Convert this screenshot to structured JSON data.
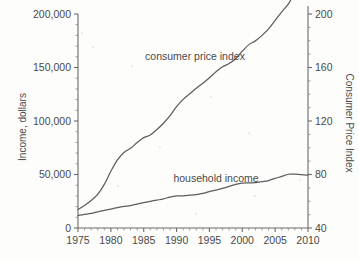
{
  "chart_data": {
    "type": "line",
    "title": "",
    "xlabel": "",
    "xlim": [
      1975,
      2010
    ],
    "x_ticks": [
      1975,
      1980,
      1985,
      1990,
      1995,
      2000,
      2005,
      2010
    ],
    "x_tick_labels": [
      "1975",
      "1980",
      "1985",
      "1990",
      "1995",
      "2000",
      "2005",
      "2010"
    ],
    "x_minor_tick_step": 1,
    "grid": false,
    "legend_position": "inline-annotations",
    "left_axis": {
      "label": "Income, dollars",
      "ylim": [
        0,
        200000
      ],
      "ticks": [
        0,
        50000,
        100000,
        150000,
        200000
      ],
      "tick_labels": [
        "0",
        "50,000",
        "100,000",
        "150,000",
        "200,000"
      ],
      "minor_tick_step": 10000
    },
    "right_axis": {
      "label": "Consumer Price Index",
      "ylim": [
        40,
        200
      ],
      "ticks": [
        40,
        80,
        120,
        160,
        200
      ],
      "tick_labels": [
        "40",
        "80",
        "120",
        "160",
        "200"
      ],
      "minor_tick_step": 10
    },
    "line_color": "#5d5d5d",
    "axis_color": "#6b6b6b",
    "background_color": "#fdfdfb",
    "series": [
      {
        "name": "consumer price index",
        "axis": "right",
        "annotation": "consumer price index",
        "x": [
          1975,
          1976,
          1977,
          1978,
          1979,
          1980,
          1981,
          1982,
          1983,
          1984,
          1985,
          1986,
          1987,
          1988,
          1989,
          1990,
          1991,
          1992,
          1993,
          1994,
          1995,
          1996,
          1997,
          1998,
          1999,
          2000,
          2001,
          2002,
          2003,
          2004,
          2005,
          2006,
          2007,
          2008,
          2009,
          2010
        ],
        "values": [
          53.8,
          56.9,
          60.6,
          65.2,
          72.6,
          82.4,
          90.9,
          96.5,
          99.6,
          103.9,
          107.6,
          109.6,
          113.6,
          118.3,
          124.0,
          130.7,
          136.2,
          140.3,
          144.5,
          148.2,
          152.4,
          156.9,
          160.5,
          163.0,
          166.6,
          172.2,
          177.1,
          179.9,
          184.0,
          188.9,
          195.3,
          201.6,
          207.3,
          215.3,
          214.5,
          218.1
        ]
      },
      {
        "name": "household income",
        "axis": "left",
        "annotation": "household income",
        "x": [
          1975,
          1976,
          1977,
          1978,
          1979,
          1980,
          1981,
          1982,
          1983,
          1984,
          1985,
          1986,
          1987,
          1988,
          1989,
          1990,
          1991,
          1992,
          1993,
          1994,
          1995,
          1996,
          1997,
          1998,
          1999,
          2000,
          2001,
          2002,
          2003,
          2004,
          2005,
          2006,
          2007,
          2008,
          2009,
          2010
        ],
        "values": [
          11800,
          12686,
          13572,
          15064,
          16461,
          17710,
          19074,
          20171,
          20885,
          22415,
          23618,
          24897,
          26061,
          27225,
          28906,
          29943,
          30126,
          30636,
          31241,
          32264,
          34076,
          35492,
          37005,
          38885,
          40816,
          41990,
          42228,
          42409,
          43318,
          44334,
          46326,
          48201,
          50233,
          50303,
          49777,
          49445
        ]
      }
    ],
    "annotations": [
      {
        "text": "consumer price index",
        "x_pixel": 195,
        "y_pixel": 60
      },
      {
        "text": "household income",
        "x_pixel": 216,
        "y_pixel": 182
      }
    ]
  }
}
